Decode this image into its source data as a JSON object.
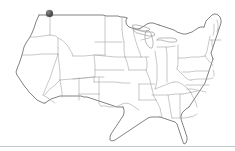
{
  "widget": {
    "name": "us-state-outline-map",
    "title": "United States Map",
    "width": 235,
    "height": 151,
    "background_color": "#ffffff"
  },
  "map": {
    "region": "Contiguous United States",
    "projection_hint": "albers-usa",
    "style": {
      "state_border_color": "#9c9c9c",
      "national_outline_color": "#5a5a5a",
      "lake_outline_color": "#8d8d8d",
      "fill_color": "#ffffff",
      "state_border_width": 0.55,
      "national_outline_width": 0.75
    },
    "features_visible": [
      "national-outline",
      "state-borders",
      "great-lakes",
      "florida-peninsula",
      "cape-cod",
      "chesapeake-bay",
      "long-island",
      "baja-gulf-coast"
    ]
  },
  "markers": [
    {
      "id": "marker-1",
      "name": "map-marker",
      "shape": "filled-circle",
      "color": "#2e2e2e",
      "x": 49,
      "y": 13,
      "diameter": 7,
      "approx_location": "Northern Idaho / Eastern Washington"
    }
  ],
  "divider": {
    "name": "bottom-divider",
    "color": "#c8c8c8",
    "y": 146,
    "thickness": 1
  }
}
